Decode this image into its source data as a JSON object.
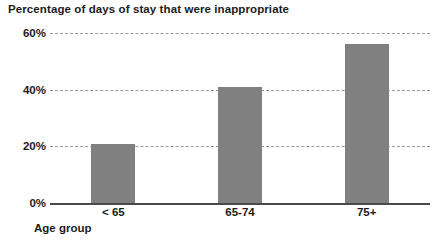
{
  "chart_data": {
    "type": "bar",
    "title": "Percentage of days of stay that were inappropriate",
    "xlabel": "Age group",
    "ylabel": "",
    "categories": [
      "< 65",
      "65-74",
      "75+"
    ],
    "values": [
      21,
      41,
      56
    ],
    "value_unit": "%",
    "ylim": [
      0,
      60
    ],
    "ytick_values": [
      0,
      20,
      40,
      60
    ],
    "ytick_labels": [
      "0%",
      "20%",
      "40%",
      "60%"
    ],
    "grid": true,
    "grid_style": "dashed",
    "legend": false,
    "series": [
      {
        "name": "Percentage of days of stay that were inappropriate",
        "values": [
          21,
          41,
          56
        ]
      }
    ],
    "colors": {
      "bar_fill": "#808080",
      "gridline": "#9a9a9a",
      "axis_line": "#4a4a4a",
      "text": "#1b1b1b",
      "background": "#ffffff"
    }
  }
}
